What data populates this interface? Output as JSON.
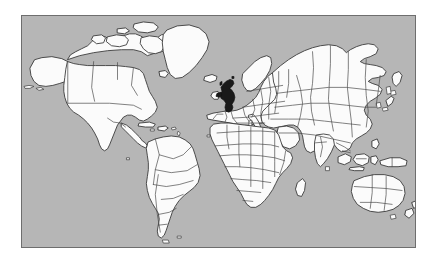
{
  "figure": {
    "type": "locator-map",
    "projection": "equirectangular",
    "caption": "",
    "frame": {
      "border_color": "#6e6e6e",
      "border_width_px": 1.5,
      "x": 21,
      "y": 15,
      "width": 395,
      "height": 233
    },
    "colors": {
      "ocean": "#b6b6b6",
      "land": "#fbfbfb",
      "coastline": "#3a3a3a",
      "country_border": "#4a4a4a",
      "highlight": "#1a1a1a",
      "page_background": "#ffffff"
    },
    "legend": [],
    "labels": [],
    "highlighted_regions": [
      {
        "name": "United Kingdom",
        "color": "#1a1a1a",
        "approx_center_px": [
          210,
          94
        ]
      }
    ],
    "continents": [
      "North America",
      "South America",
      "Europe",
      "Africa",
      "Asia",
      "Australia",
      "Greenland"
    ]
  }
}
